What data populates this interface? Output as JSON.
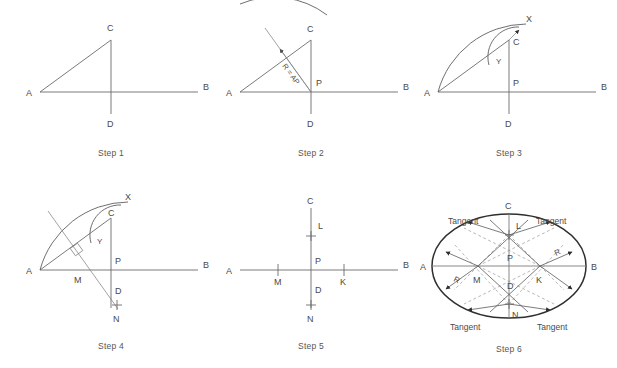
{
  "figure": {
    "title_text": "",
    "background_color": "#ffffff",
    "line_color": "#6b6b6b",
    "ellipse_color": "#2e2e2e",
    "dashed_color": "#9a9a9a",
    "text_color": "#4a4a4a"
  },
  "steps": [
    {
      "id": "step-1",
      "caption": "Step 1",
      "labels": {
        "a": "A",
        "b": "B",
        "c": "C",
        "d": "D"
      }
    },
    {
      "id": "step-2",
      "caption": "Step 2",
      "labels": {
        "a": "A",
        "b": "B",
        "c": "C",
        "d": "D",
        "p": "P",
        "radius": "R = AP"
      }
    },
    {
      "id": "step-3",
      "caption": "Step 3",
      "labels": {
        "a": "A",
        "b": "B",
        "c": "C",
        "d": "D",
        "p": "P",
        "x": "X",
        "y": "Y"
      }
    },
    {
      "id": "step-4",
      "caption": "Step 4",
      "labels": {
        "a": "A",
        "b": "B",
        "c": "C",
        "d": "D",
        "p": "P",
        "x": "X",
        "y": "Y",
        "m": "M",
        "n": "N"
      }
    },
    {
      "id": "step-5",
      "caption": "Step 5",
      "labels": {
        "a": "A",
        "b": "B",
        "c": "C",
        "d": "D",
        "p": "P",
        "l": "L",
        "m": "M",
        "n": "N",
        "k": "K"
      }
    },
    {
      "id": "step-6",
      "caption": "Step 6",
      "labels": {
        "a": "A",
        "b": "B",
        "c": "C",
        "d": "D",
        "p": "P",
        "l": "L",
        "m": "M",
        "n": "N",
        "k": "K",
        "r_left": "R",
        "r_right": "R",
        "tangent_tl": "Tangent",
        "tangent_tr": "Tangent",
        "tangent_bl": "Tangent",
        "tangent_br": "Tangent"
      }
    }
  ]
}
